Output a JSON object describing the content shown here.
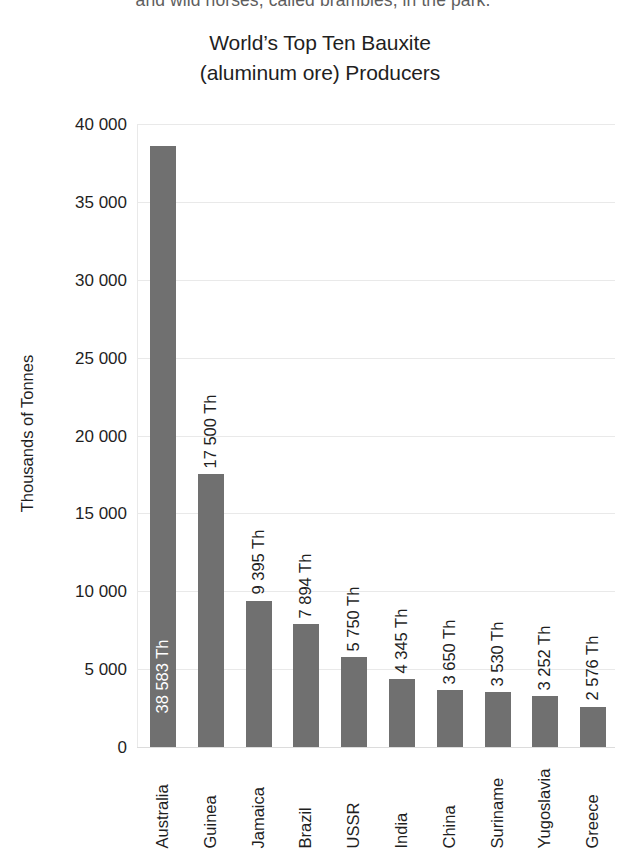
{
  "page_text_fragment": "and wild horses, called brambles, in the park.",
  "chart_data": {
    "type": "bar",
    "title": "World’s Top Ten Bauxite (aluminum ore) Producers",
    "title_lines": [
      "World’s Top Ten Bauxite",
      "(aluminum ore) Producers"
    ],
    "xlabel": "",
    "ylabel": "Thousands of Tonnes",
    "ylim": [
      0,
      40000
    ],
    "grid": true,
    "legend": false,
    "bar_color": "#707070",
    "gridline_color": "#e9e9e9",
    "value_label_suffix": "Th",
    "ytick_labels": [
      "40 000",
      "35 000",
      "30 000",
      "25 000",
      "20 000",
      "15 000",
      "10 000",
      "5 000",
      "0"
    ],
    "ytick_values": [
      40000,
      35000,
      30000,
      25000,
      20000,
      15000,
      10000,
      5000,
      0
    ],
    "categories": [
      "Australia",
      "Guinea",
      "Jamaica",
      "Brazil",
      "USSR",
      "India",
      "China",
      "Suriname",
      "Yugoslavia",
      "Greece"
    ],
    "values": [
      38583,
      17500,
      9395,
      7894,
      5750,
      4345,
      3650,
      3530,
      3252,
      2576
    ],
    "value_labels": [
      "38 583 Th",
      "17 500 Th",
      "9 395 Th",
      "7 894 Th",
      "5 750 Th",
      "4 345 Th",
      "3 650 Th",
      "3 530 Th",
      "3 252 Th",
      "2 576 Th"
    ],
    "label_placement": [
      "inside",
      "outside",
      "outside",
      "outside",
      "outside",
      "outside",
      "outside",
      "outside",
      "outside",
      "outside"
    ]
  }
}
